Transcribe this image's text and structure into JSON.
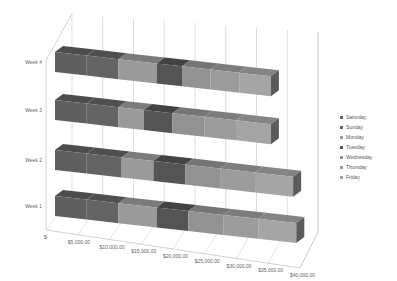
{
  "chart_data": {
    "type": "bar",
    "orientation": "horizontal",
    "stacked": true,
    "three_d": true,
    "title": "",
    "xlabel": "",
    "ylabel": "",
    "categories": [
      "Week 1",
      "Week 2",
      "Week 3",
      "Week 4"
    ],
    "x_tick_labels": [
      "$-",
      "$5,000.00",
      "$10,000.00",
      "$15,000.00",
      "$20,000.00",
      "$25,000.00",
      "$30,000.00",
      "$35,000.00",
      "$40,000.00"
    ],
    "xlim": [
      0,
      40000
    ],
    "grid": true,
    "legend_position": "right",
    "series": [
      {
        "name": "Saturday",
        "color": "#5f5f5f",
        "values": [
          5000,
          5000,
          5000,
          5000
        ]
      },
      {
        "name": "Sunday",
        "color": "#636363",
        "values": [
          5000,
          5500,
          5000,
          5000
        ]
      },
      {
        "name": "Monday",
        "color": "#9a9a9a",
        "values": [
          6000,
          5000,
          4000,
          6000
        ]
      },
      {
        "name": "Tuesday",
        "color": "#545454",
        "values": [
          5000,
          5000,
          4500,
          4000
        ]
      },
      {
        "name": "Wednesday",
        "color": "#929292",
        "values": [
          5500,
          5500,
          5000,
          4500
        ]
      },
      {
        "name": "Thursday",
        "color": "#9c9c9c",
        "values": [
          5500,
          5500,
          5000,
          4500
        ]
      },
      {
        "name": "Friday",
        "color": "#a5a5a5",
        "values": [
          6000,
          6000,
          5500,
          5000
        ]
      }
    ]
  },
  "legend": {
    "items": [
      {
        "label": "Saturday",
        "color": "#5f5f5f"
      },
      {
        "label": "Sunday",
        "color": "#636363"
      },
      {
        "label": "Monday",
        "color": "#9a9a9a"
      },
      {
        "label": "Tuesday",
        "color": "#545454"
      },
      {
        "label": "Wednesday",
        "color": "#929292"
      },
      {
        "label": "Thursday",
        "color": "#9c9c9c"
      },
      {
        "label": "Friday",
        "color": "#a5a5a5"
      }
    ]
  }
}
